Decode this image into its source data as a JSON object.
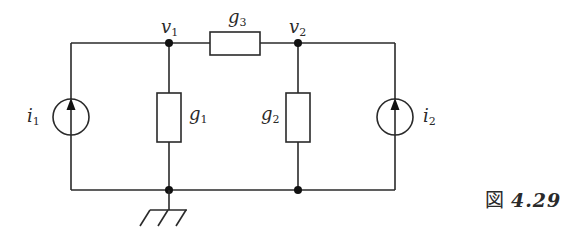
{
  "diagram": {
    "type": "circuit",
    "nodes": {
      "v1": {
        "label": "v",
        "sub": "1"
      },
      "v2": {
        "label": "v",
        "sub": "2"
      }
    },
    "components": {
      "g1": {
        "label": "g",
        "sub": "1",
        "kind": "conductance"
      },
      "g2": {
        "label": "g",
        "sub": "2",
        "kind": "conductance"
      },
      "g3": {
        "label": "g",
        "sub": "3",
        "kind": "conductance"
      },
      "i1": {
        "label": "i",
        "sub": "1",
        "kind": "current-source",
        "direction": "up"
      },
      "i2": {
        "label": "i",
        "sub": "2",
        "kind": "current-source",
        "direction": "up"
      }
    },
    "ground": {
      "kind": "ground",
      "at": "bottom-node-left"
    }
  },
  "caption": {
    "prefix": "図",
    "number": "4.29"
  }
}
